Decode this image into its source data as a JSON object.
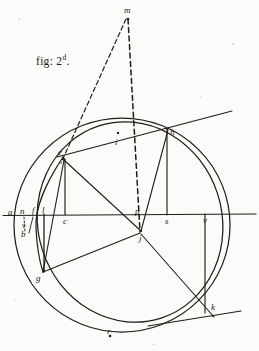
{
  "figure": {
    "caption_prefix": "fig: 2",
    "caption_sup": "d",
    "caption_suffix": ".",
    "ink_color": "#1d1a17",
    "paper_color": "#fbfbf9",
    "width": 259,
    "height": 351
  },
  "labels": {
    "m": "m",
    "i": "i",
    "h": "h",
    "e": "e",
    "a": "a",
    "n": "n",
    "f": "f",
    "l": "l",
    "c": "c",
    "p": "p",
    "s": "s",
    "v_right": "v",
    "j": "j",
    "b": "b",
    "v_left": "v",
    "g": "g",
    "k": "k",
    "r": "r"
  },
  "points": [
    {
      "name": "m",
      "label": "m",
      "x": 127,
      "y": 14,
      "marker": true
    },
    {
      "name": "i",
      "label": "i",
      "x": 118,
      "y": 137,
      "marker": true
    },
    {
      "name": "h",
      "label": "h",
      "x": 166,
      "y": 126,
      "marker": true
    },
    {
      "name": "e",
      "label": "e",
      "x": 64,
      "y": 155,
      "marker": true
    },
    {
      "name": "a",
      "label": "a",
      "x": 10,
      "y": 215,
      "marker": false
    },
    {
      "name": "n",
      "label": "n",
      "x": 22,
      "y": 215,
      "marker": false
    },
    {
      "name": "f",
      "label": "f",
      "x": 33,
      "y": 215,
      "marker": false
    },
    {
      "name": "l",
      "label": "l",
      "x": 44,
      "y": 215,
      "marker": false
    },
    {
      "name": "c",
      "label": "c",
      "x": 65,
      "y": 215,
      "marker": false
    },
    {
      "name": "p",
      "label": "p",
      "x": 138,
      "y": 214,
      "marker": true
    },
    {
      "name": "s",
      "label": "s",
      "x": 167,
      "y": 215,
      "marker": false
    },
    {
      "name": "v",
      "label": "v",
      "x": 205,
      "y": 215,
      "marker": false
    },
    {
      "name": "j",
      "label": "j",
      "x": 141,
      "y": 234,
      "marker": true
    },
    {
      "name": "v2",
      "label": "v",
      "x": 24,
      "y": 228,
      "marker": false
    },
    {
      "name": "b",
      "label": "b",
      "x": 23,
      "y": 237,
      "marker": false
    },
    {
      "name": "g",
      "label": "g",
      "x": 40,
      "y": 272,
      "marker": true
    },
    {
      "name": "k",
      "label": "k",
      "x": 213,
      "y": 311,
      "marker": true
    },
    {
      "name": "r",
      "label": "r",
      "x": 109,
      "y": 331,
      "marker": true
    }
  ],
  "geometry": {
    "outer_circle": {
      "cx": 122,
      "cy": 225,
      "rx": 108,
      "ry": 107
    },
    "inner_ellipse": {
      "cx": 130,
      "cy": 222,
      "rx": 92,
      "ry": 101,
      "rotation": -18
    },
    "horizontal_axis": {
      "x1": 3,
      "y1": 215,
      "x2": 256,
      "y2": 214
    },
    "tangent_at_h": {
      "x1": 58,
      "y1": 156,
      "x2": 231,
      "y2": 112
    },
    "tangent_at_k": {
      "x1": 150,
      "y1": 325,
      "x2": 240,
      "y2": 311
    },
    "dashed_m_to_e": {
      "x1": 126,
      "y1": 18,
      "x2": 62,
      "y2": 162
    },
    "dashed_m_to_j": {
      "x1": 128,
      "y1": 18,
      "x2": 140,
      "y2": 232
    },
    "chords": [
      {
        "name": "e-j",
        "x1": 64,
        "y1": 160,
        "x2": 141,
        "y2": 231
      },
      {
        "name": "j-h",
        "x1": 141,
        "y1": 231,
        "x2": 168,
        "y2": 130
      },
      {
        "name": "j-g",
        "x1": 140,
        "y1": 233,
        "x2": 43,
        "y2": 272
      },
      {
        "name": "j-k",
        "x1": 141,
        "y1": 234,
        "x2": 213,
        "y2": 316
      },
      {
        "name": "e-g",
        "x1": 64,
        "y1": 160,
        "x2": 43,
        "y2": 272
      }
    ],
    "ordinates": [
      {
        "name": "e-c",
        "x1": 65,
        "y1": 160,
        "x2": 65,
        "y2": 214
      },
      {
        "name": "h-s",
        "x1": 167,
        "y1": 130,
        "x2": 167,
        "y2": 215
      },
      {
        "name": "g-l",
        "x1": 44,
        "y1": 214,
        "x2": 44,
        "y2": 271
      },
      {
        "name": "k-v",
        "x1": 205,
        "y1": 214,
        "x2": 205,
        "y2": 312
      }
    ],
    "short_dashes": [
      {
        "name": "n-b",
        "x1": 24,
        "y1": 216,
        "x2": 25,
        "y2": 233
      },
      {
        "name": "f-tick",
        "x1": 33,
        "y1": 216,
        "x2": 30,
        "y2": 233
      }
    ]
  }
}
